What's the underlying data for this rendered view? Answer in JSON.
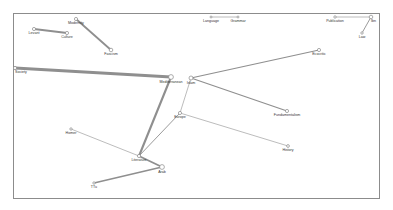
{
  "diagram": {
    "type": "network-graph",
    "nodes": [
      {
        "id": "levant",
        "label": "Levant"
      },
      {
        "id": "culture",
        "label": "Culture"
      },
      {
        "id": "modernity",
        "label": "Modernity"
      },
      {
        "id": "fascism",
        "label": "Fascism"
      },
      {
        "id": "language",
        "label": "Language"
      },
      {
        "id": "grammar",
        "label": "Grammar"
      },
      {
        "id": "publication",
        "label": "Publication"
      },
      {
        "id": "ibn",
        "label": "Ibn"
      },
      {
        "id": "law",
        "label": "Law"
      },
      {
        "id": "society",
        "label": "Society"
      },
      {
        "id": "mediterranean",
        "label": "Mediterranean"
      },
      {
        "id": "islam",
        "label": "Islam"
      },
      {
        "id": "ecocritic",
        "label": "Ecocritic"
      },
      {
        "id": "fundamentalism",
        "label": "Fundamentalism"
      },
      {
        "id": "europe",
        "label": "Europe"
      },
      {
        "id": "history",
        "label": "History"
      },
      {
        "id": "homer",
        "label": "Homer"
      },
      {
        "id": "literature",
        "label": "Literature"
      },
      {
        "id": "arab",
        "label": "Arab"
      },
      {
        "id": "ttu",
        "label": "TTu"
      }
    ],
    "edges": [
      {
        "source": "levant",
        "target": "culture",
        "weight": 3
      },
      {
        "source": "modernity",
        "target": "fascism",
        "weight": 3
      },
      {
        "source": "language",
        "target": "grammar",
        "weight": 1
      },
      {
        "source": "publication",
        "target": "ibn",
        "weight": 1
      },
      {
        "source": "ibn",
        "target": "law",
        "weight": 1.5
      },
      {
        "source": "society",
        "target": "mediterranean",
        "weight": 5
      },
      {
        "source": "mediterranean",
        "target": "literature",
        "weight": 3.5
      },
      {
        "source": "islam",
        "target": "ecocritic",
        "weight": 2
      },
      {
        "source": "islam",
        "target": "fundamentalism",
        "weight": 2
      },
      {
        "source": "islam",
        "target": "europe",
        "weight": 1
      },
      {
        "source": "europe",
        "target": "history",
        "weight": 1
      },
      {
        "source": "europe",
        "target": "literature",
        "weight": 1.5
      },
      {
        "source": "homer",
        "target": "literature",
        "weight": 1
      },
      {
        "source": "literature",
        "target": "arab",
        "weight": 3
      },
      {
        "source": "arab",
        "target": "ttu",
        "weight": 2.5
      }
    ]
  }
}
